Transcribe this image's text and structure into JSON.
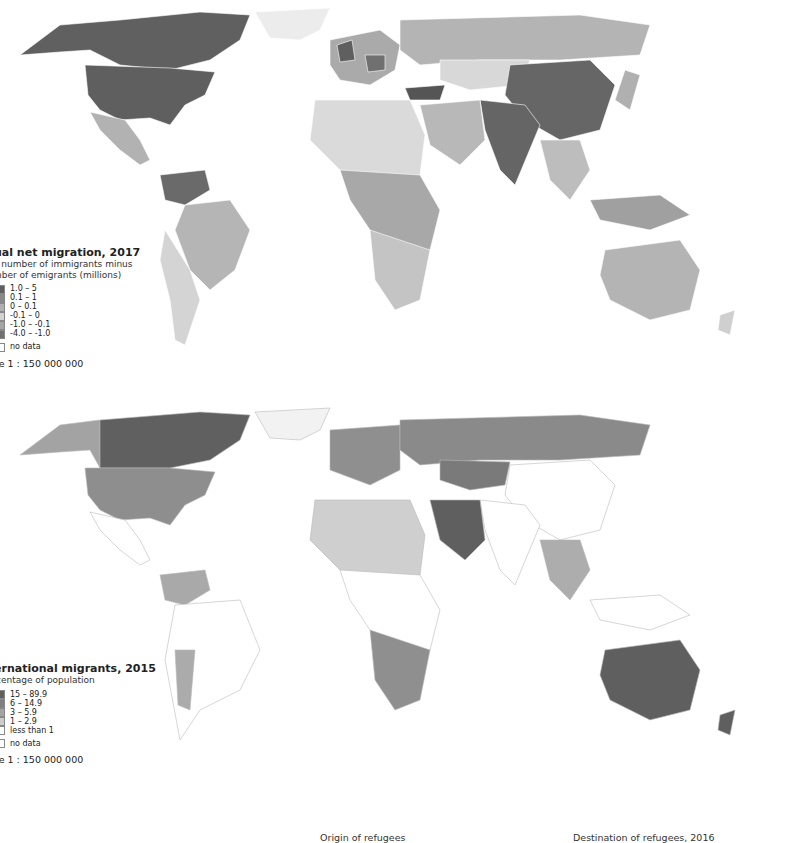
{
  "maps": [
    {
      "id": "net-migration",
      "legend": {
        "title": "ual net migration, 2017",
        "subtitle_line1": "l number of immigrants minus",
        "subtitle_line2": "nber of emigrants (millions)",
        "classes": [
          {
            "label": "1.0 – 5",
            "color": "#5f5f5f"
          },
          {
            "label": "0.1 – 1",
            "color": "#8a8a8a"
          },
          {
            "label": "0 – 0.1",
            "color": "#b0b0b0"
          },
          {
            "label": "-0.1 – 0",
            "color": "#d2d2d2"
          },
          {
            "label": "-1.0 – -0.1",
            "color": "#a5a5a5"
          },
          {
            "label": "-4.0 – -1.0",
            "color": "#707070"
          }
        ],
        "no_data": {
          "label": "no data",
          "color": "#ffffff"
        },
        "scale": "le 1 : 150 000 000"
      }
    },
    {
      "id": "international-migrants",
      "legend": {
        "title": "ernational migrants, 2015",
        "subtitle_line1": "centage of population",
        "classes": [
          {
            "label": "15 – 89.9",
            "color": "#5f5f5f"
          },
          {
            "label": "6 – 14.9",
            "color": "#808080"
          },
          {
            "label": "3 – 5.9",
            "color": "#a3a3a3"
          },
          {
            "label": "1 – 2.9",
            "color": "#cccccc"
          },
          {
            "label": "less than 1",
            "color": "#ffffff"
          }
        ],
        "no_data": {
          "label": "no data",
          "color": "#ffffff"
        },
        "scale": "le 1 : 150 000 000"
      }
    }
  ],
  "captions": {
    "left": "Origin of refugees",
    "right": "Destination of refugees, 2016"
  }
}
